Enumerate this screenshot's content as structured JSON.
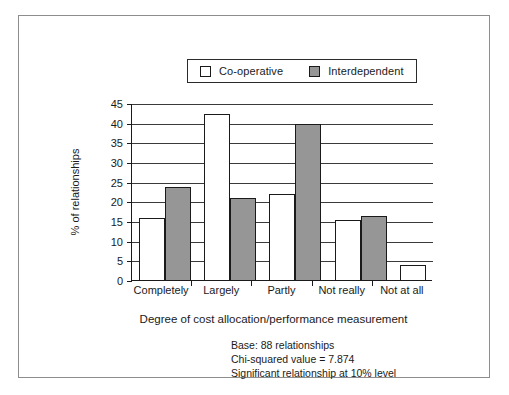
{
  "figure": {
    "frame_color": "#8d8d8d"
  },
  "legend": {
    "position": "top-center",
    "entries": [
      {
        "label": "Co-operative",
        "swatch": "#ffffff",
        "icon": "square-outline-icon"
      },
      {
        "label": "Interdependent",
        "swatch": "#969696",
        "icon": "square-filled-icon"
      }
    ]
  },
  "axes": {
    "ylabel": "% of relationships",
    "xlabel": "Degree of cost allocation/performance measurement",
    "yticks": [
      "0",
      "5",
      "10",
      "15",
      "20",
      "25",
      "30",
      "35",
      "40",
      "45"
    ]
  },
  "footnotes": [
    "Base: 88 relationships",
    "Chi-squared value = 7.874",
    "Significant relationship at 10% level"
  ],
  "chart_data": {
    "type": "bar",
    "title": "",
    "subtitle": "",
    "categories": [
      "Completely",
      "Largely",
      "Partly",
      "Not really",
      "Not at all"
    ],
    "series": [
      {
        "name": "Co-operative",
        "color": "#ffffff",
        "values": [
          16,
          42.5,
          22,
          15.5,
          4
        ]
      },
      {
        "name": "Interdependent",
        "color": "#969696",
        "values": [
          24,
          21,
          40,
          16.5,
          0
        ]
      }
    ],
    "xlabel": "Degree of cost allocation/performance measurement",
    "ylabel": "% of relationships",
    "ylim": [
      0,
      45
    ],
    "ytick_step": 5,
    "grid": true,
    "legend_position": "top-center",
    "annotations": [
      "Base: 88 relationships",
      "Chi-squared value = 7.874",
      "Significant relationship at 10% level"
    ]
  }
}
